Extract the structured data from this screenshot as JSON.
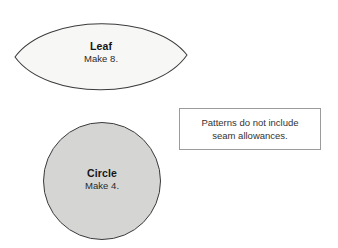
{
  "document": {
    "type": "sewing-pattern-template-sheet",
    "background_color": "#ffffff"
  },
  "pieces": [
    {
      "id": "leaf",
      "shape": "pointed-oval",
      "name": "Leaf",
      "quantity_label": "Make 8.",
      "fill_color": "#f7f7f6",
      "stroke_color": "#3b3b3b"
    },
    {
      "id": "circle",
      "shape": "circle",
      "name": "Circle",
      "quantity_label": "Make 4.",
      "fill_color": "#d5d5d4",
      "stroke_color": "#3b3b3b"
    }
  ],
  "note": {
    "line1": "Patterns do not include",
    "line2": "seam allowances.",
    "border_color": "#9b9b9b",
    "background_color": "#ffffff"
  }
}
